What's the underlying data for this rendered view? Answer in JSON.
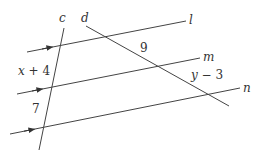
{
  "diagram": {
    "type": "parallel-lines-transversals",
    "lines": {
      "l": {
        "label": "l",
        "x1": 27,
        "y1": 52,
        "x2": 186,
        "y2": 21
      },
      "m": {
        "label": "m",
        "x1": 17,
        "y1": 94,
        "x2": 200,
        "y2": 58
      },
      "n": {
        "label": "n",
        "x1": 10,
        "y1": 134,
        "x2": 240,
        "y2": 88
      },
      "c": {
        "label": "c",
        "x1": 64,
        "y1": 28,
        "x2": 39,
        "y2": 150
      },
      "d": {
        "label": "d",
        "x1": 86,
        "y1": 26,
        "x2": 229,
        "y2": 106
      }
    },
    "segment_labels": {
      "c_upper": "x + 4",
      "c_lower": "7",
      "d_upper": "9",
      "d_lower": "y − 3"
    },
    "colors": {
      "stroke": "#444444",
      "text": "#333333"
    }
  }
}
